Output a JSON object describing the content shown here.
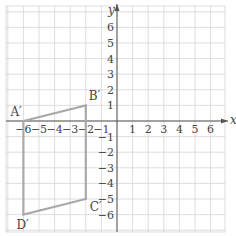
{
  "chart_data": {
    "type": "scatter",
    "title": "",
    "xlabel": "x",
    "ylabel": "y",
    "xlim": [
      -7,
      7
    ],
    "ylim": [
      -7,
      7
    ],
    "grid": true,
    "x_ticks": [
      "-6",
      "-5",
      "-4",
      "-3",
      "-2",
      "-1",
      "1",
      "2",
      "3",
      "4",
      "5",
      "6"
    ],
    "x_tick_values": [
      -6,
      -5,
      -4,
      -3,
      -2,
      -1,
      1,
      2,
      3,
      4,
      5,
      6
    ],
    "y_ticks": [
      "6",
      "5",
      "4",
      "3",
      "2",
      "1",
      "-1",
      "-2",
      "-3",
      "-4",
      "-5",
      "-6"
    ],
    "y_tick_values": [
      6,
      5,
      4,
      3,
      2,
      1,
      -1,
      -2,
      -3,
      -4,
      -5,
      -6
    ],
    "shape": {
      "type": "quadrilateral",
      "vertices": [
        {
          "label": "A′",
          "x": -6,
          "y": 0
        },
        {
          "label": "B′",
          "x": -2,
          "y": 1
        },
        {
          "label": "C′",
          "x": -2,
          "y": -5
        },
        {
          "label": "D′",
          "x": -6,
          "y": -6
        }
      ],
      "stroke_color": "#a9a9a9"
    }
  },
  "colors": {
    "grid": "#d4d4d4",
    "axis": "#555555",
    "shape": "#a9a9a9",
    "text": "#444444"
  },
  "axes": {
    "x_name": "x",
    "y_name": "y"
  }
}
